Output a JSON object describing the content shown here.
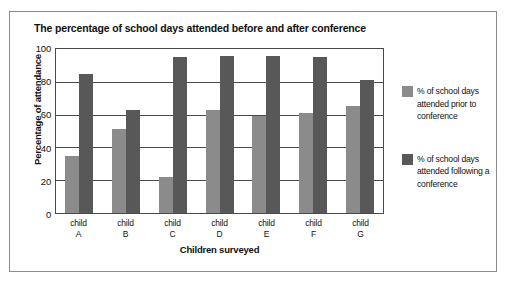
{
  "figure": {
    "title": "The percentage of school days attended before and after conference"
  },
  "chart_data": {
    "type": "bar",
    "title": "The percentage of school days attended before and after conference",
    "xlabel": "Children surveyed",
    "ylabel": "Percentage of attendance",
    "categories": [
      "child A",
      "child B",
      "child C",
      "child D",
      "child E",
      "child F",
      "child G"
    ],
    "category_lines": [
      {
        "line1": "child",
        "line2": "A"
      },
      {
        "line1": "child",
        "line2": "B"
      },
      {
        "line1": "child",
        "line2": "C"
      },
      {
        "line1": "child",
        "line2": "D"
      },
      {
        "line1": "child",
        "line2": "E"
      },
      {
        "line1": "child",
        "line2": "F"
      },
      {
        "line1": "child",
        "line2": "G"
      }
    ],
    "series": [
      {
        "name": "% of school days attended prior to conference",
        "color": "#8b8b8b",
        "values": [
          35,
          51,
          22,
          63,
          59,
          61,
          65
        ]
      },
      {
        "name": "% of school days attended following a conference",
        "color": "#585858",
        "values": [
          85,
          63,
          95,
          96,
          96,
          95,
          81
        ]
      }
    ],
    "ylim": [
      0,
      100
    ],
    "yticks": [
      0,
      20,
      40,
      60,
      80,
      100
    ],
    "ytick_labels": [
      "0",
      "20",
      "40",
      "60",
      "80",
      "100"
    ],
    "grid": "horizontal",
    "legend_position": "right"
  },
  "legend": {
    "entries": [
      {
        "label": "% of school days attended prior to conference",
        "color": "#8b8b8b"
      },
      {
        "label": "% of school days attended following a conference",
        "color": "#585858"
      }
    ]
  }
}
